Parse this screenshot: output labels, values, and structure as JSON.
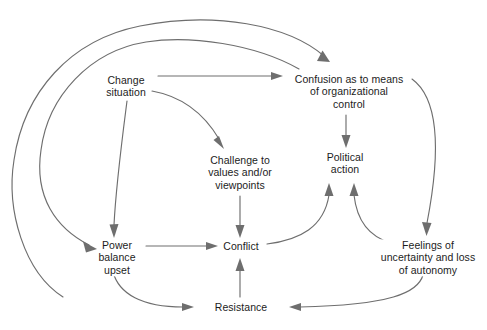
{
  "diagram": {
    "type": "flow-diagram",
    "background_color": "#ffffff",
    "line_color": "#6e6e6e",
    "text_color": "#1c1c1c",
    "nodes": [
      {
        "id": "change-situation",
        "lines": [
          "Change",
          "situation"
        ],
        "x": 126,
        "y": 86
      },
      {
        "id": "confusion",
        "lines": [
          "Confusion as to means",
          "of organizational",
          "control"
        ],
        "x": 349,
        "y": 92
      },
      {
        "id": "challenge",
        "lines": [
          "Challenge to",
          "values and/or",
          "viewpoints"
        ],
        "x": 240,
        "y": 173
      },
      {
        "id": "political-action",
        "lines": [
          "Political",
          "action"
        ],
        "x": 345,
        "y": 163
      },
      {
        "id": "power-balance",
        "lines": [
          "Power",
          "balance",
          "upset"
        ],
        "x": 117,
        "y": 258
      },
      {
        "id": "conflict",
        "lines": [
          "Conflict"
        ],
        "x": 241,
        "y": 246
      },
      {
        "id": "feelings",
        "lines": [
          "Feelings of",
          "uncertainty and loss",
          "of autonomy"
        ],
        "x": 428,
        "y": 258
      },
      {
        "id": "resistance",
        "lines": [
          "Resistance"
        ],
        "x": 241,
        "y": 307
      }
    ],
    "edges": [
      {
        "id": "change-to-confusion",
        "from": "change-situation",
        "to": "confusion"
      },
      {
        "id": "change-to-challenge",
        "from": "change-situation",
        "to": "challenge"
      },
      {
        "id": "change-to-power",
        "from": "change-situation",
        "to": "power-balance"
      },
      {
        "id": "confusion-to-political",
        "from": "confusion",
        "to": "political-action"
      },
      {
        "id": "confusion-to-feelings",
        "from": "confusion",
        "to": "feelings"
      },
      {
        "id": "challenge-to-conflict",
        "from": "challenge",
        "to": "conflict"
      },
      {
        "id": "power-to-conflict",
        "from": "power-balance",
        "to": "conflict"
      },
      {
        "id": "power-to-resistance",
        "from": "power-balance",
        "to": "resistance"
      },
      {
        "id": "conflict-to-political",
        "from": "conflict",
        "to": "political-action"
      },
      {
        "id": "feelings-to-political",
        "from": "feelings",
        "to": "political-action"
      },
      {
        "id": "feelings-to-resistance",
        "from": "feelings",
        "to": "resistance"
      },
      {
        "id": "resistance-to-conflict",
        "from": "resistance",
        "to": "conflict"
      },
      {
        "id": "resistance-loop-to-confusion",
        "from": "resistance",
        "to": "confusion"
      },
      {
        "id": "resistance-loop-to-power",
        "from": "resistance",
        "to": "power-balance"
      }
    ]
  }
}
